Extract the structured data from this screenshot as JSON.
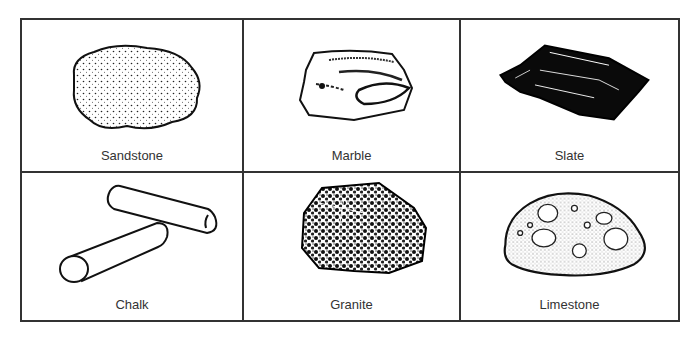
{
  "rocks": [
    {
      "name": "Sandstone",
      "icon": "sandstone-icon"
    },
    {
      "name": "Marble",
      "icon": "marble-icon"
    },
    {
      "name": "Slate",
      "icon": "slate-icon"
    },
    {
      "name": "Chalk",
      "icon": "chalk-icon"
    },
    {
      "name": "Granite",
      "icon": "granite-icon"
    },
    {
      "name": "Limestone",
      "icon": "limestone-icon"
    }
  ]
}
